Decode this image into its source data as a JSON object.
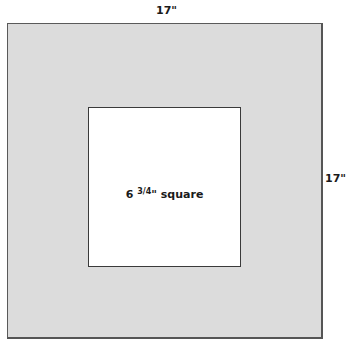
{
  "diagram": {
    "outer_square": {
      "width_label": "17\"",
      "height_label": "17\"",
      "fill_color": "#dcdcdc",
      "border_color": "#555555"
    },
    "inner_square": {
      "label_whole": "6",
      "label_fraction": "3/4",
      "label_suffix": "\" square",
      "fill_color": "#ffffff",
      "border_color": "#3a3a3a"
    }
  }
}
